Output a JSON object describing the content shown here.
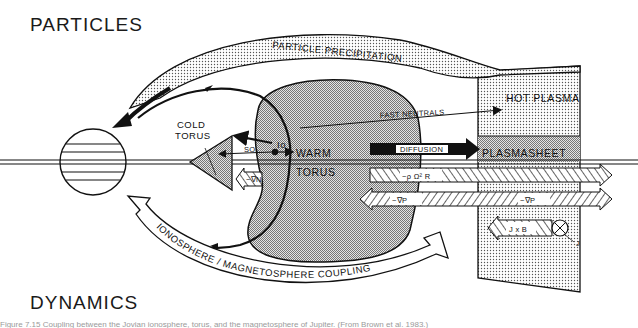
{
  "figure": {
    "headings": {
      "top": "PARTICLES",
      "bottom": "DYNAMICS"
    },
    "labels": {
      "particle_precipitation": "PARTICLE PRECIPITATION",
      "hot_plasma": "HOT PLASMA",
      "fast_neutrals": "FAST NEUTRALS",
      "cold_torus_line1": "COLD",
      "cold_torus_line2": "TORUS",
      "io": "Io",
      "so2": "SO₂",
      "warm": "WARM",
      "torus": "TORUS",
      "diffusion": "DIFFUSION",
      "plasmasheet": "PLASMASHEET",
      "centrifugal": "−ρ Ω² R",
      "pressure_grad_left": "−∇P",
      "pressure_grad_right": "−∇P",
      "neg_grad_n": "−∇N",
      "j_cross_b": "J x B",
      "current_j": "J",
      "coupling": "IONOSPHERE / MAGNETOSPHERE COUPLING"
    },
    "caption": "Figure 7.15  Coupling between the Jovian ionosphere, torus, and the magnetosphere of Jupiter. (From Brown et al. 1983.)",
    "colors": {
      "ink": "#111111",
      "stipple_light": "#d9d9d9",
      "stipple_medium": "#b8b8b8",
      "background": "#ffffff"
    }
  }
}
